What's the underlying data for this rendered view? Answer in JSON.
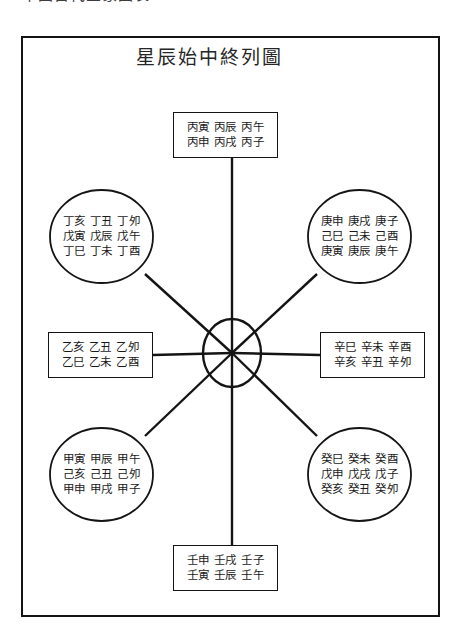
{
  "scan": {
    "header_sliver_text": "中国古代星象图表"
  },
  "figure": {
    "title": "星辰始中終列圖",
    "center": {
      "name": "center-ellipse",
      "cx": 211,
      "cy": 317,
      "rx": 29,
      "ry": 34
    },
    "nodes": [
      {
        "id": "top",
        "shape": "box",
        "rows": [
          "丙寅 丙辰 丙午",
          "丙申 丙戌 丙子"
        ],
        "x": 152,
        "y": 76,
        "w": 105,
        "h": 46
      },
      {
        "id": "top-left",
        "shape": "ellipse",
        "rows": [
          "丁亥 丁丑 丁夘",
          "戊寅 戊辰 戊午",
          "丁巳 丁未 丁酉"
        ],
        "x": 29,
        "y": 154,
        "w": 103,
        "h": 93
      },
      {
        "id": "top-right",
        "shape": "ellipse",
        "rows": [
          "庚申 庚戌 庚子",
          "己巳 己未 己酉",
          "庚寅 庚辰 庚午"
        ],
        "x": 287,
        "y": 154,
        "w": 103,
        "h": 93
      },
      {
        "id": "left",
        "shape": "box",
        "rows": [
          "乙亥 乙丑 乙夘",
          "乙巳 乙未 乙酉"
        ],
        "x": 27,
        "y": 296,
        "w": 105,
        "h": 46
      },
      {
        "id": "right",
        "shape": "box",
        "rows": [
          "辛巳 辛未 辛酉",
          "辛亥 辛丑 辛夘"
        ],
        "x": 299,
        "y": 296,
        "w": 105,
        "h": 46
      },
      {
        "id": "bottom-left",
        "shape": "ellipse",
        "rows": [
          "甲寅 甲辰 甲午",
          "己亥 己丑 己夘",
          "甲申 甲戌 甲子"
        ],
        "x": 29,
        "y": 392,
        "w": 103,
        "h": 93
      },
      {
        "id": "bottom-right",
        "shape": "ellipse",
        "rows": [
          "癸巳 癸未 癸酉",
          "戊申 戊戌 戊子",
          "癸亥 癸丑 癸夘"
        ],
        "x": 287,
        "y": 392,
        "w": 103,
        "h": 93
      },
      {
        "id": "bottom",
        "shape": "box",
        "rows": [
          "壬申 壬戌 壬子",
          "壬寅 壬辰 壬午"
        ],
        "x": 152,
        "y": 509,
        "w": 105,
        "h": 46
      }
    ],
    "colors": {
      "ink": "#141414",
      "paper": "#ffffff",
      "text": "#1a1a1a"
    }
  }
}
